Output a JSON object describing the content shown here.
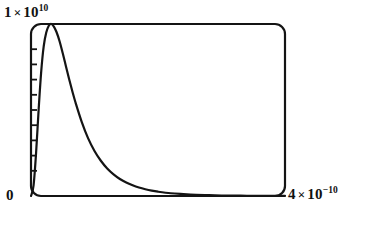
{
  "figure": {
    "name": "distribution-plot",
    "background_color": "#ffffff",
    "ink_color": "#141414"
  },
  "labels": {
    "y_max": {
      "mantissa": "1",
      "times": "×",
      "base": "10",
      "exponent": "10",
      "plain": "1 × 10¹⁰"
    },
    "y_min": {
      "plain": "0"
    },
    "x_max": {
      "mantissa": "4",
      "times": "×",
      "base": "10",
      "exponent": "−10",
      "plain": "4 × 10⁻¹⁰"
    }
  },
  "chart_data": {
    "type": "line",
    "title": "",
    "xlabel": "",
    "ylabel": "",
    "xlim": [
      0,
      4e-10
    ],
    "ylim": [
      0,
      10000000000.0
    ],
    "xtick_labels": [
      "0",
      "4 × 10⁻¹⁰"
    ],
    "ytick_labels": [
      "0",
      "1 × 10¹⁰"
    ],
    "grid": false,
    "legend": null,
    "frame": {
      "style": "rounded-box",
      "corner_radius_px": 10,
      "left_axis_minor_ticks": 9,
      "bottom_axis_ticks": 0,
      "right_axis_ticks": 0,
      "top_axis_ticks": 0
    },
    "series": [
      {
        "name": "spectral-distribution",
        "color": "#141414",
        "line_width_px": 2.2,
        "x": [
          0.0,
          4e-12,
          8e-12,
          1.2e-11,
          1.6e-11,
          2e-11,
          2.4e-11,
          2.8e-11,
          3.2e-11,
          3.6e-11,
          4e-11,
          4.5e-11,
          5e-11,
          5.5e-11,
          6e-11,
          6.5e-11,
          7e-11,
          8e-11,
          9e-11,
          1e-10,
          1.1e-10,
          1.2e-10,
          1.3e-10,
          1.4e-10,
          1.5e-10,
          1.6e-10,
          1.7e-10,
          1.8e-10,
          1.9e-10,
          2e-10,
          2.2e-10,
          2.4e-10,
          2.6e-10,
          2.8e-10,
          3e-10,
          3.2e-10,
          3.4e-10,
          3.6e-10,
          3.8e-10,
          4e-10
        ],
        "y": [
          0.0,
          600000000.0,
          2500000000.0,
          5000000000.0,
          7200000000.0,
          8700000000.0,
          9500000000.0,
          9900000000.0,
          10000000000.0,
          9850000000.0,
          9550000000.0,
          9000000000.0,
          8300000000.0,
          7550000000.0,
          6800000000.0,
          6100000000.0,
          5450000000.0,
          4300000000.0,
          3350000000.0,
          2620000000.0,
          2050000000.0,
          1600000000.0,
          1260000000.0,
          990000000.0,
          780000000.0,
          620000000.0,
          490000000.0,
          390000000.0,
          310000000.0,
          250000000.0,
          160000000.0,
          110000000.0,
          70000000.0,
          50000000.0,
          30000000.0,
          20000000.0,
          15000000.0,
          10000000.0,
          7000000.0,
          5000000.0
        ]
      }
    ]
  }
}
